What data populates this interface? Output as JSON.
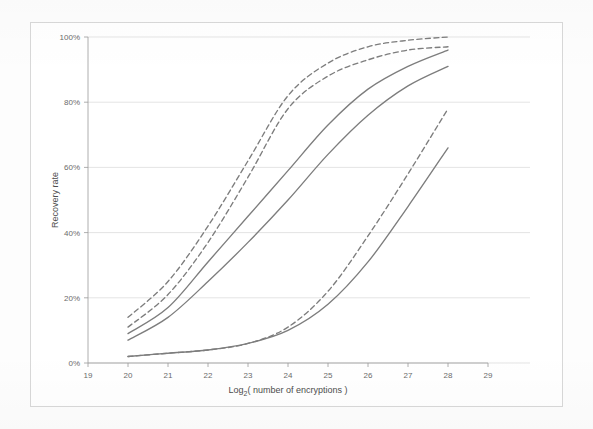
{
  "chart_data": {
    "type": "line",
    "title": "",
    "subtitle": "",
    "xlabel": "Log₂( number of encryptions )",
    "ylabel": "Recovery rate",
    "xlim": [
      19,
      29
    ],
    "ylim": [
      0,
      100
    ],
    "grid": "horizontal",
    "legend": "none",
    "xticks": [
      "19",
      "20",
      "21",
      "22",
      "23",
      "24",
      "25",
      "26",
      "27",
      "28",
      "29"
    ],
    "yticks": [
      "0%",
      "20%",
      "40%",
      "60%",
      "80%",
      "100%"
    ],
    "x": [
      20,
      21,
      22,
      23,
      24,
      25,
      26,
      27,
      28
    ],
    "series": [
      {
        "name": "upper-dashed-1",
        "style": "dashed",
        "color": "#7d7d7d",
        "values": [
          14,
          25,
          42,
          62,
          82,
          92,
          97,
          99,
          100
        ]
      },
      {
        "name": "upper-dashed-2",
        "style": "dashed",
        "color": "#7d7d7d",
        "values": [
          11,
          21,
          37,
          57,
          78,
          88,
          93,
          96,
          97
        ]
      },
      {
        "name": "upper-solid-1",
        "style": "solid",
        "color": "#7d7d7d",
        "values": [
          9,
          17,
          31,
          45,
          59,
          73,
          84,
          91,
          96
        ]
      },
      {
        "name": "upper-solid-2",
        "style": "solid",
        "color": "#7d7d7d",
        "values": [
          7,
          14,
          25,
          37,
          50,
          64,
          76,
          85,
          91
        ]
      },
      {
        "name": "lower-dashed",
        "style": "dashed",
        "color": "#7d7d7d",
        "values": [
          2,
          3,
          4,
          6,
          11,
          22,
          39,
          58,
          78
        ]
      },
      {
        "name": "lower-solid",
        "style": "solid",
        "color": "#7d7d7d",
        "values": [
          2,
          3,
          4,
          6,
          10,
          18,
          31,
          48,
          66
        ]
      }
    ]
  },
  "axes": {
    "y_title": "Recovery rate",
    "x_title_prefix": "Log",
    "x_title_sub": "2",
    "x_title_suffix": "( number of encryptions )"
  }
}
